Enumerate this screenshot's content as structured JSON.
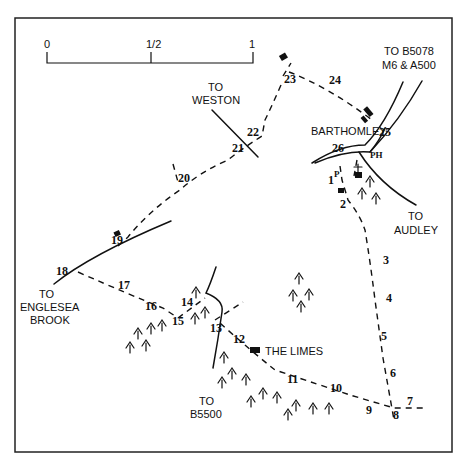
{
  "scale_bar": {
    "labels": [
      "0",
      "1/2",
      "1"
    ],
    "unit": "miles"
  },
  "places": {
    "barthomley": "BARTHOMLEY",
    "the_limes": "THE LIMES",
    "ph": "PH",
    "parking": "P"
  },
  "road_labels": {
    "weston": [
      "TO",
      "WESTON"
    ],
    "b5078": [
      "TO B5078",
      "M6 & A500"
    ],
    "audley": [
      "TO",
      "AUDLEY"
    ],
    "englesea": [
      "TO",
      "ENGLESEA",
      "BROOK"
    ],
    "b5500": [
      "TO",
      "B5500"
    ]
  },
  "waypoints": [
    {
      "n": "1",
      "x": 328,
      "y": 184
    },
    {
      "n": "2",
      "x": 340,
      "y": 208
    },
    {
      "n": "3",
      "x": 383,
      "y": 264
    },
    {
      "n": "4",
      "x": 386,
      "y": 302
    },
    {
      "n": "5",
      "x": 381,
      "y": 340
    },
    {
      "n": "6",
      "x": 390,
      "y": 377
    },
    {
      "n": "7",
      "x": 407,
      "y": 405
    },
    {
      "n": "8",
      "x": 393,
      "y": 419
    },
    {
      "n": "9",
      "x": 366,
      "y": 414
    },
    {
      "n": "10",
      "x": 330,
      "y": 392
    },
    {
      "n": "11",
      "x": 287,
      "y": 383
    },
    {
      "n": "12",
      "x": 233,
      "y": 343
    },
    {
      "n": "13",
      "x": 210,
      "y": 332
    },
    {
      "n": "14",
      "x": 181,
      "y": 306
    },
    {
      "n": "15",
      "x": 172,
      "y": 325
    },
    {
      "n": "16",
      "x": 145,
      "y": 310
    },
    {
      "n": "17",
      "x": 118,
      "y": 289
    },
    {
      "n": "18",
      "x": 56,
      "y": 275
    },
    {
      "n": "19",
      "x": 111,
      "y": 244
    },
    {
      "n": "20",
      "x": 178,
      "y": 182
    },
    {
      "n": "21",
      "x": 232,
      "y": 152
    },
    {
      "n": "22",
      "x": 247,
      "y": 136
    },
    {
      "n": "23",
      "x": 284,
      "y": 83
    },
    {
      "n": "24",
      "x": 329,
      "y": 84
    },
    {
      "n": "25",
      "x": 379,
      "y": 136
    },
    {
      "n": "26",
      "x": 332,
      "y": 152
    }
  ]
}
